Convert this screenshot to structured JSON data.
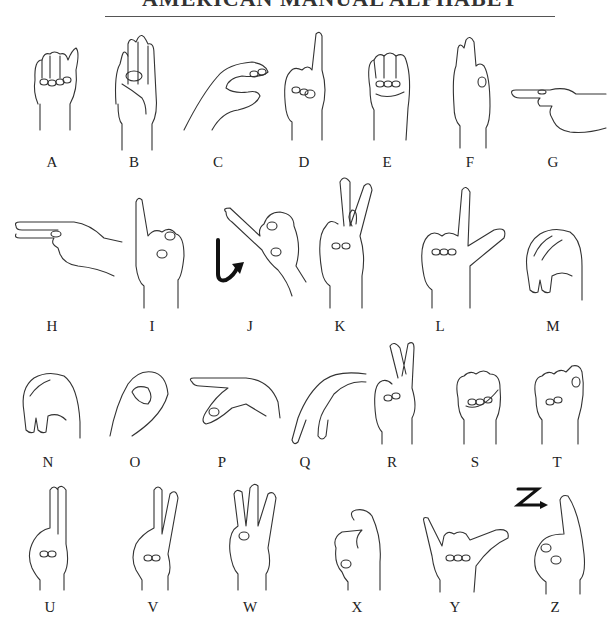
{
  "header": {
    "title": "AMERICAN MANUAL ALPHABET"
  },
  "rows": [
    {
      "letters": [
        {
          "letter": "A",
          "shape": "fist-thumb-side",
          "x": 52
        },
        {
          "letter": "B",
          "shape": "flat-hand-thumb-across",
          "x": 134
        },
        {
          "letter": "C",
          "shape": "curved-c",
          "x": 218
        },
        {
          "letter": "D",
          "shape": "index-up-circle",
          "x": 304
        },
        {
          "letter": "E",
          "shape": "fingers-curled-over-thumb",
          "x": 387
        },
        {
          "letter": "F",
          "shape": "three-up-circle",
          "x": 470
        },
        {
          "letter": "G",
          "shape": "index-point-side",
          "x": 553
        }
      ]
    },
    {
      "letters": [
        {
          "letter": "H",
          "shape": "two-point-side",
          "x": 52
        },
        {
          "letter": "I",
          "shape": "pinky-up",
          "x": 152
        },
        {
          "letter": "J",
          "shape": "pinky-up-hook-motion",
          "x": 250
        },
        {
          "letter": "K",
          "shape": "index-middle-up-thumb-between",
          "x": 340
        },
        {
          "letter": "L",
          "shape": "index-thumb-l",
          "x": 440
        },
        {
          "letter": "M",
          "shape": "three-over-thumb",
          "x": 553
        }
      ]
    },
    {
      "letters": [
        {
          "letter": "N",
          "shape": "two-over-thumb",
          "x": 48
        },
        {
          "letter": "O",
          "shape": "round-o",
          "x": 135
        },
        {
          "letter": "P",
          "shape": "k-pointing-down",
          "x": 222
        },
        {
          "letter": "Q",
          "shape": "g-pointing-down",
          "x": 305
        },
        {
          "letter": "R",
          "shape": "crossed-fingers",
          "x": 392
        },
        {
          "letter": "S",
          "shape": "fist-thumb-front",
          "x": 475
        },
        {
          "letter": "T",
          "shape": "thumb-between-index-middle",
          "x": 557
        }
      ]
    },
    {
      "letters": [
        {
          "letter": "U",
          "shape": "two-up-together",
          "x": 50
        },
        {
          "letter": "V",
          "shape": "two-up-apart",
          "x": 153
        },
        {
          "letter": "W",
          "shape": "three-up-apart",
          "x": 250
        },
        {
          "letter": "X",
          "shape": "index-hooked",
          "x": 357
        },
        {
          "letter": "Y",
          "shape": "thumb-pinky-out",
          "x": 455
        },
        {
          "letter": "Z",
          "shape": "index-trace-z",
          "x": 555
        }
      ]
    }
  ],
  "motion_markers": {
    "J": {
      "icon": "hook-arrow-icon",
      "color": "#111111"
    },
    "Z": {
      "icon": "z-arrow-icon",
      "color": "#111111",
      "glyph": "Z"
    }
  },
  "colors": {
    "line": "#333333",
    "background": "#ffffff",
    "text": "#222222"
  }
}
